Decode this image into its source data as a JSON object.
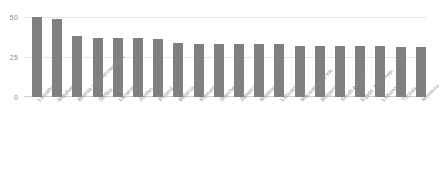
{
  "chart_data": {
    "type": "bar",
    "title": "",
    "subtitle": "",
    "xlabel": "",
    "ylabel": "",
    "ylim": [
      0,
      50
    ],
    "yticks": [
      0,
      25,
      50
    ],
    "ytick_labels": [
      "0",
      "25",
      "50"
    ],
    "grid": true,
    "legend": false,
    "legend_position": "none",
    "bar_color": "#808080",
    "gridline_color": "#e6e6e6",
    "axis_text_color": "#8a8a8a",
    "categories": [
      "Lesotho",
      "Maldives",
      "Bosnia and Herzegovina",
      "Serbia",
      "Ukraine",
      "Jordan",
      "Poland",
      "Belarus",
      "Romania",
      "Seychelles",
      "Jamaica",
      "Moldova",
      "Lithuania",
      "Macedonia, FYR",
      "Bulgaria",
      "South Africa",
      "Egypt, Arab Rep.",
      "Lebanon",
      "Tunisia",
      "Morocco"
    ],
    "values": [
      50,
      49,
      38,
      37,
      37,
      37,
      36,
      34,
      33,
      33,
      33,
      33,
      33,
      32,
      32,
      32,
      32,
      32,
      31,
      31
    ]
  }
}
